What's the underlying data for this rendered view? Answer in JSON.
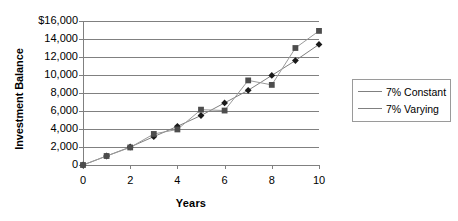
{
  "chart_data": {
    "type": "line",
    "title": "",
    "xlabel": "Years",
    "ylabel": "Investment Balance",
    "x": [
      0,
      1,
      2,
      3,
      4,
      5,
      6,
      7,
      8,
      9,
      10
    ],
    "xlim": [
      0,
      10
    ],
    "ylim": [
      0,
      16000
    ],
    "xticks": [
      "0",
      "2",
      "4",
      "6",
      "8",
      "10"
    ],
    "xtick_values": [
      0,
      2,
      4,
      6,
      8,
      10
    ],
    "yticks": [
      "0",
      "2,000",
      "4,000",
      "6,000",
      "8,000",
      "10,000",
      "12,000",
      "14,000",
      "$16,000"
    ],
    "ytick_values": [
      0,
      2000,
      4000,
      6000,
      8000,
      10000,
      12000,
      14000,
      16000
    ],
    "grid": "horizontal",
    "legend_position": "right",
    "series": [
      {
        "name": "7% Constant",
        "marker": "diamond",
        "color": "#1a1a1a",
        "line_color": "#808080",
        "values": [
          0,
          1000,
          2000,
          3150,
          4300,
          5500,
          6900,
          8300,
          9950,
          11600,
          13400
        ]
      },
      {
        "name": "7% Varying",
        "marker": "square",
        "color": "#4d4d4d",
        "line_color": "#9a9a9a",
        "values": [
          0,
          1000,
          1950,
          3450,
          3950,
          6150,
          6050,
          9400,
          8900,
          13000,
          14900
        ]
      }
    ]
  },
  "legend": {
    "items": [
      {
        "label": "7% Constant",
        "marker": "diamond"
      },
      {
        "label": "7% Varying",
        "marker": "square"
      }
    ]
  },
  "axes": {
    "y_title": "Investment Balance",
    "x_title": "Years"
  },
  "colors": {
    "axis": "#808080",
    "gridline": "#808080",
    "series_1": "#1a1a1a",
    "series_2": "#4d4d4d",
    "legend_border": "#9a9a9a",
    "background": "#ffffff"
  }
}
